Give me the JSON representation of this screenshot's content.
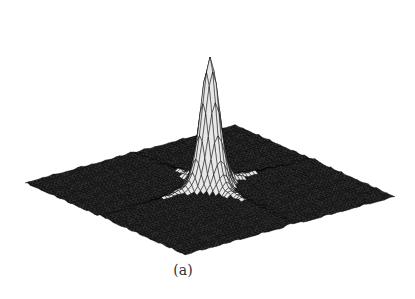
{
  "figure": {
    "caption": "(a)",
    "colors": {
      "background": "#ffffff",
      "mesh_dark": "#1a1a1a",
      "mesh_light": "#e8e8e8",
      "mesh_line": "#000000"
    }
  },
  "chart_data": {
    "type": "surface3d",
    "title": "",
    "subtitle": "(a)",
    "xlabel": "",
    "ylabel": "",
    "zlabel": "",
    "grid": false,
    "axes_visible": false,
    "legend": null,
    "domain": {
      "x": [
        -1,
        1
      ],
      "y": [
        -1,
        1
      ]
    },
    "peak": {
      "x": 0,
      "y": 0,
      "z": 1.0
    },
    "baseline_z": 0.0,
    "ridges": [
      {
        "direction": "x",
        "relative_height": 0.12
      },
      {
        "direction": "y",
        "relative_height": 0.12
      }
    ],
    "projection": {
      "left_corner": [
        25,
        183
      ],
      "right_corner": [
        395,
        197
      ],
      "front_corner": [
        185,
        255
      ],
      "back_corner": [
        235,
        125
      ],
      "peak_apex": [
        209,
        22
      ]
    }
  }
}
